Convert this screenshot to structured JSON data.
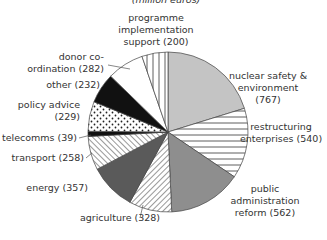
{
  "chart_data": {
    "type": "pie",
    "title": "",
    "subtitle": "(million euros)",
    "start": "top",
    "direction": "clockwise",
    "slices": [
      {
        "label": "nuclear safety & environment",
        "value": 767,
        "fill": "light-gray",
        "lines": [
          "nuclear safety &",
          "environment",
          "(767)"
        ]
      },
      {
        "label": "restructuring enterprises",
        "value": 540,
        "fill": "horizontal-hatch",
        "lines": [
          "restructuring",
          "enterprises (540)"
        ]
      },
      {
        "label": "public administration reform",
        "value": 562,
        "fill": "mid-gray",
        "lines": [
          "public",
          "administration",
          "reform (562)"
        ]
      },
      {
        "label": "agriculture",
        "value": 328,
        "fill": "diagonal-hatch-right",
        "lines": [
          "agriculture (328)"
        ]
      },
      {
        "label": "energy",
        "value": 357,
        "fill": "dark-gray",
        "lines": [
          "energy (357)"
        ]
      },
      {
        "label": "transport",
        "value": 258,
        "fill": "diagonal-hatch-left",
        "lines": [
          "transport (258)"
        ]
      },
      {
        "label": "telecomms",
        "value": 39,
        "fill": "black",
        "lines": [
          "telecomms (39)"
        ]
      },
      {
        "label": "policy advice",
        "value": 229,
        "fill": "dots",
        "lines": [
          "policy advice",
          "(229)"
        ]
      },
      {
        "label": "other",
        "value": 232,
        "fill": "black",
        "lines": [
          "other (232)"
        ]
      },
      {
        "label": "donor co-ordination",
        "value": 282,
        "fill": "white",
        "lines": [
          "donor co-",
          "ordination (282)"
        ]
      },
      {
        "label": "programme implementation support",
        "value": 200,
        "fill": "vertical-hatch",
        "lines": [
          "programme",
          "implementation",
          "support (200)"
        ]
      }
    ],
    "units": "million euros"
  },
  "colors": {
    "light-gray": "#c4c4c4",
    "mid-gray": "#8e8e8e",
    "dark-gray": "#5a5a5a",
    "black": "#111111",
    "white": "#ffffff",
    "stroke": "#444444"
  }
}
